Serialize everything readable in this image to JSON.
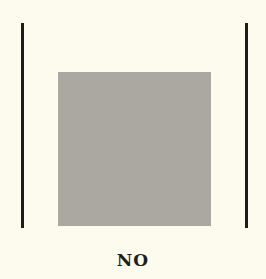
{
  "figure": {
    "caption": "NO",
    "colors": {
      "background": "#fdfbee",
      "lines": "#1c1c1c",
      "square": "#aaa8a1",
      "text": "#1e1e1e"
    }
  }
}
